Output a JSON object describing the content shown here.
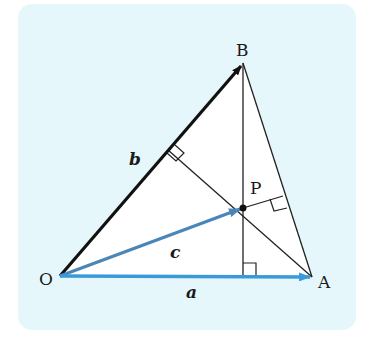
{
  "diagram": {
    "title": "",
    "type": "vector-geometry",
    "colors": {
      "panel_fill": "#e6f7fb",
      "triangle_fill": "#ffffff",
      "line": "#222222",
      "vector_b": "#111111",
      "vector_a": "#3a9ad9",
      "vector_c": "#4a86b8",
      "point_p": "#111111"
    },
    "points": {
      "O": {
        "label": "O",
        "x": 60,
        "y": 276
      },
      "A": {
        "label": "A",
        "x": 312,
        "y": 277
      },
      "B": {
        "label": "B",
        "x": 243,
        "y": 63
      },
      "P": {
        "label": "P",
        "x": 243,
        "y": 208
      }
    },
    "vectors": [
      {
        "name": "a",
        "label": "a",
        "from": "O",
        "to": "A"
      },
      {
        "name": "b",
        "label": "b",
        "from": "O",
        "to": "B"
      },
      {
        "name": "c",
        "label": "c",
        "from": "O",
        "to": "P"
      }
    ],
    "right_angle_marks": 3
  }
}
